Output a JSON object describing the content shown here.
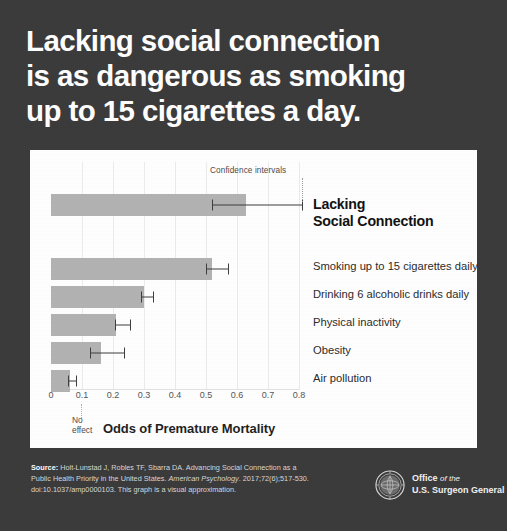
{
  "headline": {
    "line1": "Lacking social connection",
    "line2": "is as dangerous as smoking",
    "line3": "up to 15 cigarettes a day."
  },
  "chart_data": {
    "type": "bar",
    "orientation": "horizontal",
    "title": "",
    "xlabel": "Odds of Premature Mortality",
    "ylabel": "",
    "xlim": [
      0,
      0.8
    ],
    "xticks": [
      "0",
      "0.1",
      "0.2",
      "0.3",
      "0.4",
      "0.5",
      "0.6",
      "0.7",
      "0.8"
    ],
    "grid": true,
    "legend": "none",
    "annotations": {
      "confidence_intervals": "Confidence intervals",
      "no_effect_line1": "No",
      "no_effect_line2": "effect"
    },
    "categories": [
      "Lacking Social Connection",
      "Smoking up to 15 cigarettes daily",
      "Drinking 6 alcoholic drinks daily",
      "Physical inactivity",
      "Obesity",
      "Air pollution"
    ],
    "values": [
      0.63,
      0.52,
      0.3,
      0.21,
      0.16,
      0.06
    ],
    "ci_low": [
      0.52,
      0.5,
      0.29,
      0.205,
      0.125,
      0.055
    ],
    "ci_high": [
      0.81,
      0.57,
      0.33,
      0.255,
      0.235,
      0.08
    ],
    "bar_color": "#b3b3b3",
    "error_color": "#3d3d3d"
  },
  "category_labels": {
    "lead_line1": "Lacking",
    "lead_line2": "Social Connection",
    "item2": "Smoking up to 15 cigarettes daily",
    "item3": "Drinking 6 alcoholic drinks daily",
    "item4": "Physical inactivity",
    "item5": "Obesity",
    "item6": "Air pollution"
  },
  "footer": {
    "source_label": "Source:",
    "source_line1": " Holt-Lunstad J, Robles TF, Sbarra DA. Advancing Social Connection as a",
    "source_line2a": "Public Health Priority in the United States. ",
    "source_journal": "American Psychology",
    "source_line2b": ". 2017;72(6);517-530.",
    "source_line3": "doi:10.1037/amp0000103. This graph is a visual approximation.",
    "office_line1_strong": "Office ",
    "office_line1_em": "of the",
    "office_line2": "U.S. Surgeon General"
  },
  "colors": {
    "background": "#3a3a3a",
    "card": "#ffffff",
    "bar": "#b3b3b3",
    "text_light": "#ffffff"
  }
}
